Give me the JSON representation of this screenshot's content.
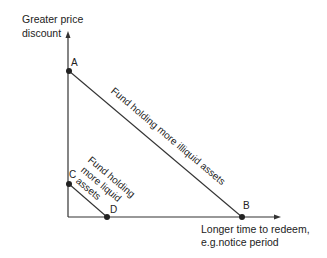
{
  "diagram": {
    "y_axis_label_line1": "Greater price",
    "y_axis_label_line2": "discount",
    "x_axis_label_line1": "Longer time to redeem,",
    "x_axis_label_line2": "e.g.notice period",
    "points": {
      "A": "A",
      "B": "B",
      "C": "C",
      "D": "D"
    },
    "lines": [
      {
        "from": "A",
        "to": "B",
        "label": "Fund holding more illiquid assets"
      },
      {
        "from": "C",
        "to": "D",
        "label_line1": "Fund holding",
        "label_line2": "more liquid",
        "label_line3": "assets"
      }
    ],
    "colors": {
      "ink": "#222222",
      "background": "#ffffff"
    }
  }
}
